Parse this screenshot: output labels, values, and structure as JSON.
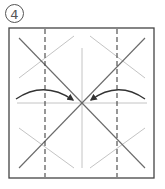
{
  "step": {
    "number": "4"
  },
  "diagram": {
    "type": "origami-fold-step",
    "frame": {
      "x": 9,
      "y": 28,
      "width": 145,
      "height": 150,
      "stroke": "#444444"
    },
    "center": {
      "x": 82,
      "y": 103
    },
    "valley_fold_lines": [
      {
        "x": 45
      },
      {
        "x": 117
      }
    ],
    "crease_color": "#b8b8b8",
    "main_diagonal_color": "#666666",
    "arrows": [
      {
        "direction": "right",
        "from": "left-edge",
        "to": "center"
      },
      {
        "direction": "left",
        "from": "right-edge",
        "to": "center"
      }
    ],
    "colors": {
      "ink": "#444444",
      "light": "#c8c8c8",
      "arrow": "#333333"
    }
  }
}
